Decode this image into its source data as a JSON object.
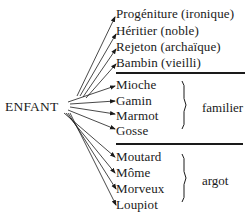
{
  "root": "ENFANT",
  "groups": [
    {
      "name": "neutral",
      "items": [
        "Progéniture (ironique)",
        "Héritier (noble)",
        "Rejeton (archaïque)",
        "Bambin (vieilli)"
      ]
    },
    {
      "name": "familier",
      "label": "familier",
      "items": [
        "Mioche",
        "Gamin",
        "Marmot",
        "Gosse"
      ]
    },
    {
      "name": "argot",
      "label": "argot",
      "items": [
        "Moutard",
        "Môme",
        "Morveux",
        "Loupiot"
      ]
    }
  ]
}
